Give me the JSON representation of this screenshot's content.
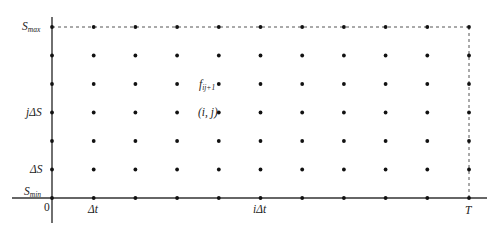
{
  "diagram": {
    "colors": {
      "axis": "#333333",
      "point": "#111111",
      "dash": "#555555",
      "text": "#222222",
      "background": "#ffffff"
    },
    "axes": {
      "origin_label": "0",
      "x_axis": {
        "tick_labels": [
          {
            "index": 1,
            "main": "Δ",
            "var": "t",
            "text": "Δt"
          },
          {
            "index": 4,
            "main": "iΔ",
            "var": "t",
            "text": "iΔt"
          },
          {
            "index": 10,
            "main": "",
            "var": "T",
            "text": "T"
          }
        ]
      },
      "y_axis": {
        "tick_labels": [
          {
            "index": 0,
            "main": "S",
            "sub": "min",
            "text": "S_min"
          },
          {
            "index": 1,
            "main": "ΔS",
            "sub": "",
            "text": "ΔS"
          },
          {
            "index": 3,
            "main": "jΔS",
            "sub": "",
            "text": "jΔS"
          },
          {
            "index": 6,
            "main": "S",
            "sub": "max",
            "text": "S_max"
          }
        ]
      }
    },
    "grid": {
      "time_steps": 10,
      "price_steps": 6
    },
    "point_labels": [
      {
        "i": 4,
        "j": 4,
        "main": "f",
        "sub": "ij+1",
        "text": "f_{ij+1}"
      },
      {
        "i": 4,
        "j": 3,
        "main": "(i, j)",
        "sub": "",
        "text": "(i, j)"
      }
    ],
    "boundaries": {
      "top": "S_max dashed line",
      "right": "T dashed line"
    }
  }
}
